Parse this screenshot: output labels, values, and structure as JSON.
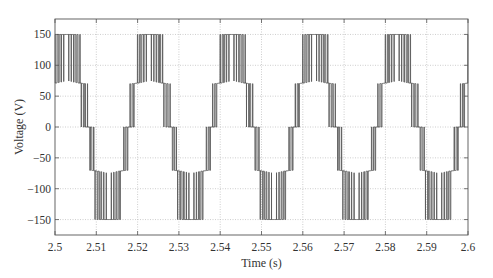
{
  "chart_data": {
    "type": "line",
    "title": "",
    "xlabel": "Time (s)",
    "ylabel": "Voltage (V)",
    "xlim": [
      2.5,
      2.6
    ],
    "ylim": [
      -175,
      175
    ],
    "xticks": [
      2.5,
      2.51,
      2.52,
      2.53,
      2.54,
      2.55,
      2.56,
      2.57,
      2.58,
      2.59,
      2.6
    ],
    "xtick_labels": [
      "2.5",
      "2.51",
      "2.52",
      "2.53",
      "2.54",
      "2.55",
      "2.56",
      "2.57",
      "2.58",
      "2.59",
      "2.6"
    ],
    "yticks": [
      150,
      100,
      50,
      0,
      -50,
      -100,
      -150
    ],
    "ytick_labels": [
      "150",
      "100",
      "50",
      "0",
      "−50",
      "−100",
      "−150"
    ],
    "grid": true,
    "legend": null,
    "series": [
      {
        "name": "Five-level inverter output voltage",
        "description": "Multilevel PWM waveform switching between levels -150, -75, 0, 75, 150 V; fundamental 50 Hz (period 0.02 s); positive peak bands centered near t = 2.503 + 0.02k, negative peak bands near t = 2.513 + 0.02k",
        "levels": [
          -150,
          -75,
          0,
          75,
          150
        ],
        "fundamental_hz": 50,
        "carrier_hz": 1650,
        "modulation_index": 0.66,
        "phase_peak_time": 2.503,
        "level_sag_v": 6,
        "envelope_points": {
          "t": [
            2.5,
            2.5005,
            2.505,
            2.508,
            2.5115,
            2.5155,
            2.518,
            2.5205,
            2.525,
            2.528,
            2.5315,
            2.5355,
            2.538,
            2.5405,
            2.545,
            2.548,
            2.5515,
            2.5555,
            2.558,
            2.5605,
            2.565,
            2.568,
            2.5715,
            2.5755,
            2.578,
            2.5805,
            2.585,
            2.588,
            2.5915,
            2.5955,
            2.598,
            2.6
          ],
          "v_max": [
            75,
            150,
            150,
            75,
            0,
            -75,
            75,
            150,
            150,
            75,
            0,
            -75,
            75,
            150,
            150,
            75,
            0,
            -75,
            75,
            150,
            150,
            75,
            0,
            -75,
            75,
            150,
            150,
            75,
            0,
            -75,
            75,
            75
          ],
          "v_min": [
            70,
            70,
            70,
            0,
            -150,
            -150,
            0,
            70,
            70,
            0,
            -150,
            -150,
            0,
            70,
            70,
            0,
            -150,
            -150,
            0,
            70,
            70,
            0,
            -150,
            -150,
            0,
            70,
            70,
            0,
            -150,
            -150,
            0,
            70
          ]
        }
      }
    ],
    "colors": {
      "trace": "#5a5a5a",
      "trace_fill": "#9a9a9a",
      "grid": "#b8b8b8",
      "axes": "#555555",
      "text": "#333333",
      "background": "#ffffff"
    }
  },
  "layout": {
    "plot_left": 55,
    "plot_right": 468,
    "plot_top": 19,
    "plot_bottom": 235
  }
}
